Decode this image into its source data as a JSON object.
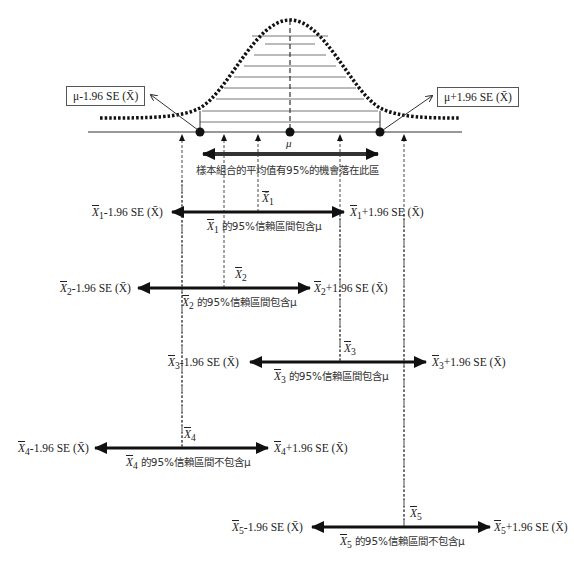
{
  "diagram": {
    "title": "",
    "curve": {
      "type": "normal-distribution",
      "mean_label": "μ",
      "peak_x": 290,
      "baseline_y": 132
    },
    "boundary_boxes": {
      "left": "μ-1.96 SE (X̄)",
      "right": "μ+1.96 SE (X̄)"
    },
    "central_region_label": "樣本組合的平均值有95%的機會落在此區",
    "mu_symbol": "μ",
    "intervals": [
      {
        "sample": "X̄",
        "subscript": "1",
        "lower_label": "-1.96 SE (X̄)",
        "upper_label": "+1.96 SE (X̄)",
        "caption": "的95%信賴區間包含μ",
        "contains_mu": true
      },
      {
        "sample": "X̄",
        "subscript": "2",
        "lower_label": "-1.96 SE (X̄)",
        "upper_label": "+1.96 SE (X̄)",
        "caption": "的95%信賴區間包含μ",
        "contains_mu": true
      },
      {
        "sample": "X̄",
        "subscript": "3",
        "lower_label": "-1.96 SE (X̄)",
        "upper_label": "+1.96 SE (X̄)",
        "caption": "的95%信賴區間包含μ",
        "contains_mu": true
      },
      {
        "sample": "X̄",
        "subscript": "4",
        "lower_label": "-1.96 SE (X̄)",
        "upper_label": "+1.96 SE (X̄)",
        "caption": "的95%信賴區間不包含μ",
        "contains_mu": false
      },
      {
        "sample": "X̄",
        "subscript": "5",
        "lower_label": "-1.96 SE (X̄)",
        "upper_label": "+1.96 SE (X̄)",
        "caption": "的95%信賴區間不包含μ",
        "contains_mu": false
      }
    ]
  }
}
